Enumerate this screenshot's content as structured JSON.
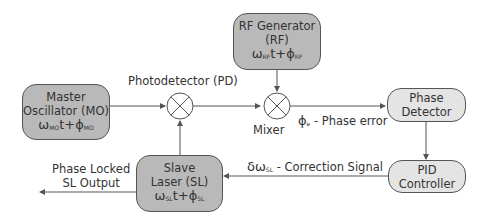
{
  "blocks": {
    "master_oscillator": {
      "line1": "Master",
      "line2": "Oscillator (MO)",
      "omega": "ω",
      "omega_sub": "MO",
      "mid": "t+ϕ",
      "phi_sub": "MO"
    },
    "rf_generator": {
      "line1": "RF Generator",
      "line2": "(RF)",
      "omega": "ω",
      "omega_sub": "RF",
      "mid": "t+ϕ",
      "phi_sub": "RF"
    },
    "phase_detector": {
      "line1": "Phase",
      "line2": "Detector"
    },
    "pid_controller": {
      "line1": "PID",
      "line2": "Controller"
    },
    "slave_laser": {
      "line1": "Slave",
      "line2": "Laser (SL)",
      "omega": "ω",
      "omega_sub": "SL",
      "mid": "t+ϕ",
      "phi_sub": "SL"
    }
  },
  "nodes": {
    "photodetector": "Photodetector (PD)",
    "mixer": "Mixer"
  },
  "signals": {
    "phase_error_symbol": "ϕ",
    "phase_error_sub": "e",
    "phase_error_text": " - Phase error",
    "correction_symbol": "δω",
    "correction_sub": "SL",
    "correction_text": " - Correction Signal",
    "output_line1": "Phase Locked",
    "output_line2": "SL Output"
  },
  "colors": {
    "dark_block": "#b9b9b9",
    "light_block": "#e4e4e4",
    "line": "#555555"
  }
}
